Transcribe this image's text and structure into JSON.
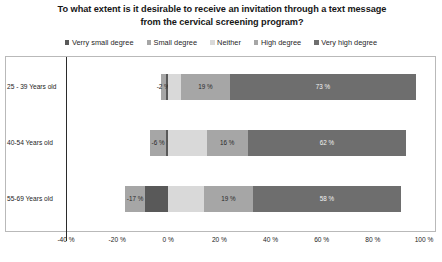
{
  "chart_data": {
    "type": "bar",
    "subtype": "diverging-stacked-horizontal-bar",
    "title": "To what extent is it desirable to receive an invitation through a text message from the cervical screening program?",
    "xlabel": "",
    "ylabel": "",
    "xlim": [
      -40,
      100
    ],
    "xticks": [
      "-40 %",
      "-20 %",
      "0 %",
      "20 %",
      "40 %",
      "60 %",
      "80 %",
      "100 %"
    ],
    "xtick_values": [
      -40,
      -20,
      0,
      20,
      40,
      60,
      80,
      100
    ],
    "grid": false,
    "legend_position": "top",
    "categories": [
      "25 - 39 Years old",
      "40-54 Years old",
      "55-69 Years old"
    ],
    "series": [
      {
        "name": "Verry small degree",
        "color": "#595959",
        "values": [
          -1,
          -1,
          -9
        ],
        "labels": [
          "-1 %",
          "-1 %",
          ""
        ]
      },
      {
        "name": "Small degree",
        "color": "#a6a6a6",
        "values": [
          -2,
          -6,
          -8
        ],
        "labels": [
          "-2 %",
          "-6 %",
          "-17 %"
        ]
      },
      {
        "name": "Neither",
        "color": "#d9d9d9",
        "values": [
          5,
          15,
          14
        ],
        "labels": [
          "",
          "",
          ""
        ]
      },
      {
        "name": "High degree",
        "color": "#a6a6a6",
        "values": [
          19,
          16,
          19
        ],
        "labels": [
          "19 %",
          "16 %",
          "19 %"
        ]
      },
      {
        "name": "Very high degree",
        "color": "#6e6e6e",
        "values": [
          73,
          62,
          58
        ],
        "labels": [
          "73 %",
          "62 %",
          "58 %"
        ]
      }
    ]
  },
  "legend": {
    "items": [
      {
        "label": "Verry small degree",
        "color": "#595959"
      },
      {
        "label": "Small degree",
        "color": "#a6a6a6"
      },
      {
        "label": "Neither",
        "color": "#d9d9d9"
      },
      {
        "label": "High degree",
        "color": "#a6a6a6"
      },
      {
        "label": "Very high degree",
        "color": "#6e6e6e"
      }
    ]
  },
  "colors": {
    "background": "#ffffff",
    "frame_border": "#b9b9b9",
    "zero_line": "#2b2b2b",
    "text": "#1a1a1a"
  }
}
